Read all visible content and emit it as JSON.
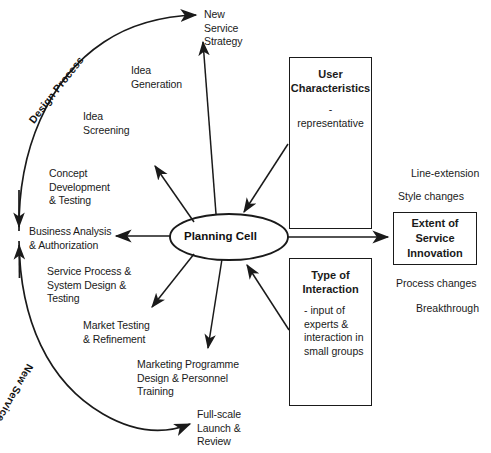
{
  "diagram": {
    "background_color": "#ffffff",
    "line_color": "#1a1a1a"
  },
  "center": {
    "label": "Planning Cell"
  },
  "arc_labels": {
    "design_process": "Design Process",
    "new_service": "New Service"
  },
  "process_stages": [
    {
      "id": "new-service-strategy",
      "label": "New\nService\nStrategy"
    },
    {
      "id": "idea-generation",
      "label": "Idea\nGeneration"
    },
    {
      "id": "idea-screening",
      "label": "Idea\nScreening"
    },
    {
      "id": "concept-development-testing",
      "label": "Concept\nDevelopment\n& Testing"
    },
    {
      "id": "business-analysis-authorization",
      "label": "Business Analysis\n& Authorization"
    },
    {
      "id": "service-process-system-design-testing",
      "label": "Service Process &\nSystem Design &\nTesting"
    },
    {
      "id": "market-testing-refinement",
      "label": "Market Testing\n& Refinement"
    },
    {
      "id": "marketing-programme-design-personnel-training",
      "label": "Marketing Programme\nDesign & Personnel\nTraining"
    },
    {
      "id": "full-scale-launch-review",
      "label": "Full-scale\nLaunch &\nReview"
    }
  ],
  "boxes": {
    "user_characteristics": {
      "title": "User\nCharacteristics",
      "body": "- representative"
    },
    "type_of_interaction": {
      "title": "Type of\nInteraction",
      "body": "- input of\n  experts &\n  interaction in\n  small groups"
    },
    "extent_of_service_innovation": {
      "title": "Extent of\nService\nInnovation"
    }
  },
  "innovation_scale": [
    {
      "id": "line-extension",
      "label": "Line-extension"
    },
    {
      "id": "style-changes",
      "label": "Style changes"
    },
    {
      "id": "process-changes",
      "label": "Process changes"
    },
    {
      "id": "breakthrough",
      "label": "Breakthrough"
    }
  ]
}
